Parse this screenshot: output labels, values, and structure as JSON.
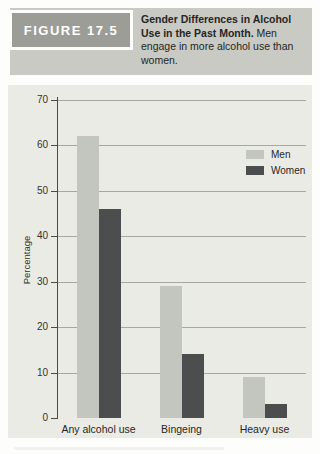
{
  "header": {
    "figure_label": "FIGURE 17.5",
    "caption_bold": "Gender Differences in Alcohol Use in the Past Month.",
    "caption_regular": " Men engage in more alcohol use than women."
  },
  "colors": {
    "figure_box_bg": "#9b9d96",
    "figure_box_text": "#ffffff",
    "caption_band_bg": "#c9cac3",
    "panel_bg": "#ebebe5",
    "gridline": "#a6a8a2",
    "axis": "#4a4a46",
    "men_bar": "#c3c5bf",
    "women_bar": "#4b4d4f"
  },
  "chart_data": {
    "type": "bar",
    "title": "",
    "categories": [
      "Any alcohol use",
      "Bingeing",
      "Heavy use"
    ],
    "series": [
      {
        "name": "Men",
        "values": [
          62,
          29,
          9
        ],
        "color": "#c3c5bf"
      },
      {
        "name": "Women",
        "values": [
          46,
          14,
          3
        ],
        "color": "#4b4d4f"
      }
    ],
    "xlabel": "",
    "ylabel": "Percentage",
    "ylim": [
      0,
      70
    ],
    "yticks": [
      0,
      10,
      20,
      30,
      40,
      50,
      60,
      70
    ],
    "grid": "horizontal",
    "legend_position": "upper right"
  }
}
